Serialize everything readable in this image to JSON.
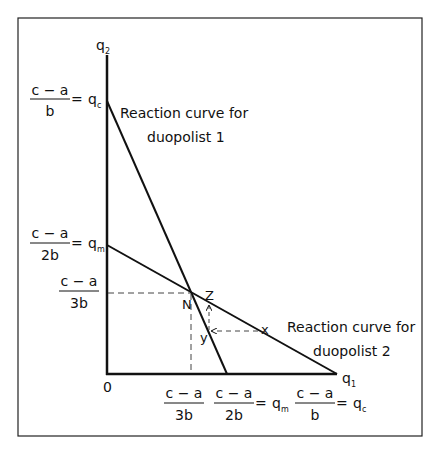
{
  "diagram": {
    "axes": {
      "y_label": "q",
      "y_label_sub": "2",
      "x_label": "q",
      "x_label_sub": "1",
      "origin": "0"
    },
    "curves": [
      {
        "name": "duopolist-1",
        "label_line1": "Reaction curve for",
        "label_line2": "duopolist 1"
      },
      {
        "name": "duopolist-2",
        "label_line1": "Reaction curve for",
        "label_line2": "duopolist 2"
      }
    ],
    "y_ticks": [
      {
        "num": "c − a",
        "den": "b",
        "eq": "=",
        "sym": "q",
        "sub": "c"
      },
      {
        "num": "c − a",
        "den": "2b",
        "eq": "=",
        "sym": "q",
        "sub": "m"
      },
      {
        "num": "c − a",
        "den": "3b"
      }
    ],
    "x_ticks": [
      {
        "num": "c − a",
        "den": "3b"
      },
      {
        "num": "c − a",
        "den": "2b",
        "eq": "=",
        "sym": "q",
        "sub": "m"
      },
      {
        "num": "c − a",
        "den": "b",
        "eq": "=",
        "sym": "q",
        "sub": "c"
      }
    ],
    "points": {
      "N": "N",
      "Z": "Z",
      "Y": "y",
      "X": "x"
    }
  }
}
